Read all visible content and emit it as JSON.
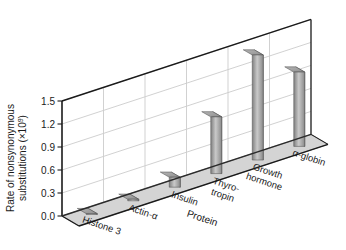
{
  "chart_data": {
    "type": "bar",
    "title": "",
    "subtitle": "",
    "xlabel": "Protein",
    "ylabel": "Rate of nonsynonymous substitutions (×10⁹)",
    "ylabel_main": "Rate of nonsynonymous",
    "ylabel_second": "substitutions (×10",
    "ylabel_exponent": "9",
    "ylabel_close": ")",
    "categories": [
      "Histone 3",
      "Actin-α",
      "Insulin",
      "Thyro-\ntropin",
      "Growth\nhormone",
      "α-globin"
    ],
    "category_lines": [
      [
        "Histone 3"
      ],
      [
        "Actin-α"
      ],
      [
        "Insulin"
      ],
      [
        "Thyro-",
        "tropin"
      ],
      [
        "Growth",
        "hormone"
      ],
      [
        "α-globin"
      ]
    ],
    "values": [
      0.01,
      0.02,
      0.13,
      0.74,
      1.37,
      0.97
    ],
    "ylim": [
      0.0,
      1.5
    ],
    "ytick_values": [
      0.0,
      0.3,
      0.6,
      0.9,
      1.2,
      1.5
    ],
    "ytick_labels": [
      "0.0",
      "0.3",
      "0.6",
      "0.9",
      "1.2",
      "1.5"
    ],
    "grid": true,
    "legend": false,
    "legend_position": "none",
    "projection": "3d-isometric",
    "bar_fill_light": "#d8d8d8",
    "bar_fill_dark": "#808080",
    "bar_stroke": "#555555",
    "floor_color": "#d4d4d4",
    "wall_color": "#ffffff",
    "grid_color": "#cccccc",
    "axis_color": "#1a1a1a",
    "annotations": []
  }
}
